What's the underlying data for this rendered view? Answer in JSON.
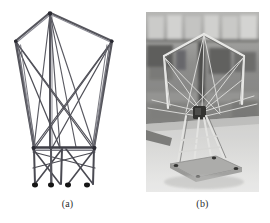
{
  "figure": {
    "kind": "two-panel-scientific-figure",
    "background_color": "#ffffff",
    "panels": [
      {
        "id": "a",
        "caption": "(a)",
        "type": "line-drawing",
        "subject": "deployable cable-strut tensegrity structure schematic",
        "line_color": "#4a4a52",
        "node_color": "#1a1a1a",
        "strut_count": 5,
        "foot_count": 4
      },
      {
        "id": "b",
        "caption": "(b)",
        "type": "photograph",
        "subject": "physical prototype of the deployable structure in a laboratory",
        "tone": "grayscale",
        "background_color": "#8e8e8e",
        "floor_color": "#e8e8e6"
      }
    ]
  },
  "captions": {
    "a": "(a)",
    "b": "(b)"
  },
  "colors": {
    "page_background": "#ffffff",
    "drawing_stroke": "#55555c",
    "drawing_stroke_light": "#8c8c95",
    "node_fill": "#161616",
    "photo_mid": "#9a9a9a",
    "photo_dark": "#3a3a3a",
    "photo_light": "#dedede"
  }
}
